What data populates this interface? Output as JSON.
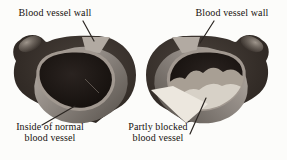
{
  "diagram": {
    "panels": [
      {
        "id": "normal",
        "top_label": "Blood vessel wall",
        "bottom_label_line1": "Inside of normal",
        "bottom_label_line2": "blood vessel"
      },
      {
        "id": "blocked",
        "top_label": "Blood vessel wall",
        "bottom_label_line1": "Partly blocked",
        "bottom_label_line2": "blood vessel"
      }
    ],
    "colors": {
      "background": "#fcfcfa",
      "text": "#17120f",
      "wall_dark": "#2f2823",
      "wall_light": "#4a423c",
      "cut_face_light": "#b2aaa2",
      "rim_gray": "#a19890",
      "lumen_dark": "#17110e",
      "plaque_mid": "#a89f94",
      "plaque_light": "#d7d1c7",
      "open_cut_bright": "#ece7de",
      "leader": "#2b2622"
    }
  }
}
